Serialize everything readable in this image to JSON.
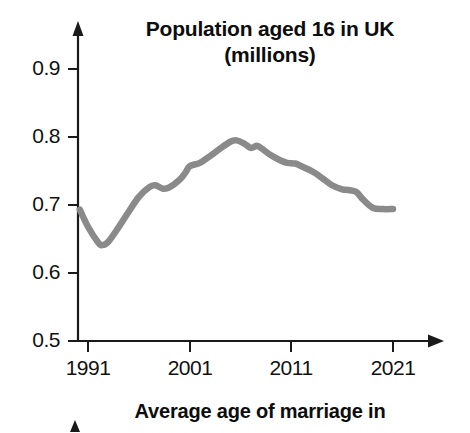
{
  "chart_data": {
    "type": "line",
    "title": "Population aged 16 in UK (millions)",
    "title_lines": [
      "Population aged 16 in UK",
      "(millions)"
    ],
    "xlabel": "",
    "ylabel": "",
    "xlim": [
      1990,
      2022
    ],
    "ylim": [
      0.5,
      0.9
    ],
    "grid": false,
    "legend": false,
    "line_color": "#8a8a8a",
    "axis_color": "#1a1a1a",
    "x_ticks": [
      "1991",
      "2001",
      "2011",
      "2021"
    ],
    "x_tick_values": [
      1991,
      2001,
      2011,
      2021
    ],
    "y_ticks": [
      "0.5",
      "0.6",
      "0.7",
      "0.8",
      "0.9"
    ],
    "y_tick_values": [
      0.5,
      0.6,
      0.7,
      0.8,
      0.9
    ],
    "x": [
      1990.2,
      1991,
      1992,
      1992.4,
      1993,
      1994,
      1995,
      1996,
      1997,
      1997.6,
      1998.4,
      1999,
      2000,
      2000.6,
      2001,
      2002,
      2003,
      2004,
      2005,
      2005.6,
      2006.4,
      2007,
      2007.6,
      2008,
      2009,
      2010,
      2010.6,
      2011.4,
      2012,
      2013,
      2014,
      2015,
      2016,
      2016.6,
      2017.4,
      2018,
      2019,
      2020,
      2021
    ],
    "values": [
      0.693,
      0.668,
      0.645,
      0.641,
      0.646,
      0.667,
      0.69,
      0.712,
      0.726,
      0.729,
      0.724,
      0.726,
      0.737,
      0.748,
      0.757,
      0.762,
      0.772,
      0.783,
      0.793,
      0.795,
      0.79,
      0.784,
      0.787,
      0.784,
      0.773,
      0.765,
      0.762,
      0.761,
      0.757,
      0.75,
      0.74,
      0.729,
      0.723,
      0.722,
      0.719,
      0.709,
      0.696,
      0.694,
      0.694
    ]
  },
  "next_chart": {
    "title": "Average age of marriage in"
  }
}
